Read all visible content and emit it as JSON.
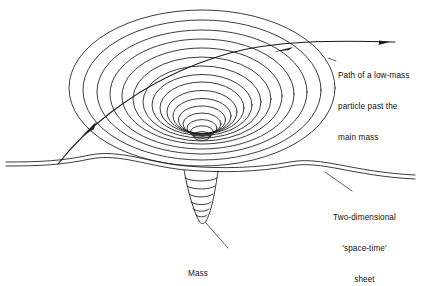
{
  "figure": {
    "type": "diagram",
    "background_color": "#ffffff",
    "ink_color": "#1a1a1a"
  },
  "labels": {
    "path": {
      "name": "path-of-particle-label",
      "line1": "Path of a low-mass",
      "line2": "particle past the",
      "line3": "main mass",
      "full_text": "Path of a low-mass particle past the main mass"
    },
    "sheet": {
      "name": "space-time-sheet-label",
      "line1": "Two-dimensional",
      "line2": "'space-time'",
      "line3": "sheet",
      "full_text": "Two-dimensional 'space-time' sheet"
    },
    "mass": {
      "name": "mass-label",
      "line1": "Mass",
      "full_text": "Mass"
    }
  },
  "elements": {
    "funnel_rings_count": 16,
    "spike_rings_count": 7,
    "sheet_lines_count": 2,
    "arrowheads_count": 2
  }
}
